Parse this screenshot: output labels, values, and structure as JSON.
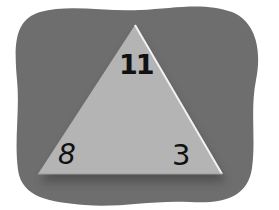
{
  "figure": {
    "type": "fact-family-triangle",
    "numbers": {
      "top": "11",
      "bottom_left": "8",
      "bottom_right": "3"
    },
    "colors": {
      "background": "#ffffff",
      "blob": "#6e6e6e",
      "triangle": "#b4b4b4",
      "highlight": "#f2f2f2",
      "text": "#111111"
    }
  }
}
